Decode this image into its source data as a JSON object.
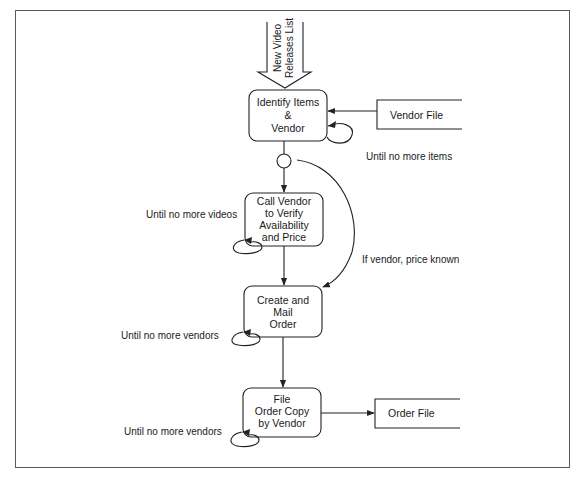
{
  "diagram": {
    "type": "process flow / structure chart",
    "input_flow": {
      "label_line1": "New Video",
      "label_line2": "Releases List"
    },
    "processes": [
      {
        "id": "p1",
        "lines": [
          "Identify Items",
          "&",
          "Vendor"
        ]
      },
      {
        "id": "p2",
        "lines": [
          "Call Vendor",
          "to Verify",
          "Availability",
          "and Price"
        ]
      },
      {
        "id": "p3",
        "lines": [
          "Create and",
          "Mail",
          "Order"
        ]
      },
      {
        "id": "p4",
        "lines": [
          "File",
          "Order Copy",
          "by Vendor"
        ]
      }
    ],
    "data_stores": [
      {
        "id": "vendor_file",
        "label": "Vendor File"
      },
      {
        "id": "order_file",
        "label": "Order File"
      }
    ],
    "loop_labels": {
      "p1": "Until no more items",
      "p2": "Until no more videos",
      "p3": "Until no more vendors",
      "p4": "Until no more vendors"
    },
    "conditional_flow": {
      "label": "If vendor, price known"
    }
  },
  "colors": {
    "line": "#222222",
    "frame": "#5a5a5a",
    "background": "#ffffff"
  }
}
